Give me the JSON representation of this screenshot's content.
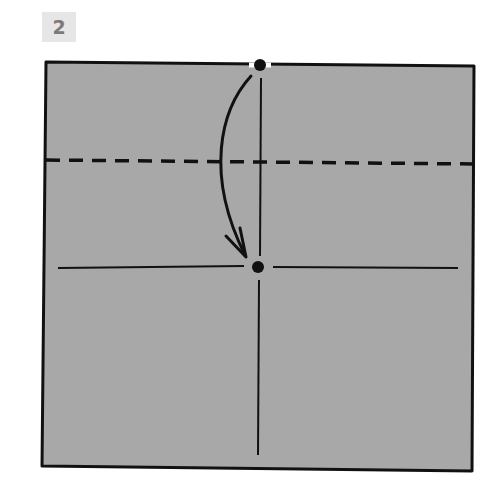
{
  "step": {
    "number": "2"
  },
  "colors": {
    "paper": "#a8a8a8",
    "ink": "#111111",
    "badge_bg": "#e6e6e6",
    "badge_text": "#7a7a7a"
  },
  "diagram": {
    "paper_square": {
      "corners": [
        [
          46,
          62
        ],
        [
          474,
          66
        ],
        [
          472,
          471
        ],
        [
          42,
          466
        ]
      ]
    },
    "valley_fold_line": {
      "style": "dashed",
      "y_left": 160,
      "y_right": 164
    },
    "creases": [
      {
        "orientation": "vertical",
        "x": 260,
        "y_from": 78,
        "y_to": 455
      },
      {
        "orientation": "horizontal",
        "y": 267,
        "x_from": 58,
        "x_to": 458
      }
    ],
    "points": [
      {
        "name": "top-midpoint",
        "x": 260,
        "y": 66
      },
      {
        "name": "center-point",
        "x": 258,
        "y": 267
      }
    ],
    "arrow": {
      "from": "top-midpoint",
      "to": "center-point",
      "direction": "down"
    }
  }
}
